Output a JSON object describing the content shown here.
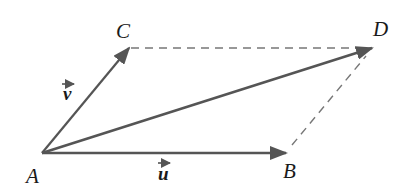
{
  "diagram": {
    "type": "vector-parallelogram",
    "points": {
      "A": {
        "label": "A",
        "x": 42,
        "y": 153
      },
      "B": {
        "label": "B",
        "x": 286,
        "y": 153
      },
      "C": {
        "label": "C",
        "x": 129,
        "y": 48
      },
      "D": {
        "label": "D",
        "x": 372,
        "y": 48
      }
    },
    "vectors": [
      {
        "name": "u",
        "label": "u",
        "from": "A",
        "to": "B"
      },
      {
        "name": "v",
        "label": "v",
        "from": "A",
        "to": "C"
      },
      {
        "name": "diagonal",
        "label": "",
        "from": "A",
        "to": "D"
      }
    ],
    "dashed_edges": [
      {
        "from": "C",
        "to": "D"
      },
      {
        "from": "B",
        "to": "D"
      }
    ],
    "labels": {
      "A": "A",
      "B": "B",
      "C": "C",
      "D": "D",
      "u": "u",
      "v": "v"
    },
    "colors": {
      "arrow": "#555555",
      "dashed": "#777777",
      "text": "#1a1a1a",
      "background": "#ffffff"
    }
  }
}
